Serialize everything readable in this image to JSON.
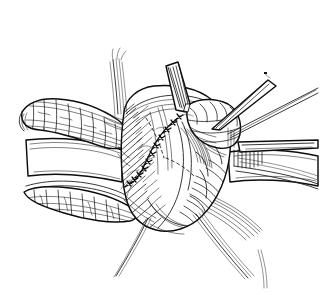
{
  "figure": {
    "kind": "line-art-illustration",
    "medium": "pen-and-ink cross-hatched drawing",
    "title": "",
    "caption": "",
    "background_color": "#ffffff",
    "ink_color": "#111111",
    "has_text": false,
    "has_color": false,
    "width": 320,
    "height": 295
  },
  "anatomy": {
    "central_mass": {
      "name": "central-organ-mass",
      "label": "",
      "description": "large rounded organ body occupying center of field, shaded with dense parallel hatching on its left flank and lower right contour",
      "bbox": [
        118,
        86,
        232,
        232
      ]
    },
    "upper_left_tube": {
      "name": "upper-left-tubular-structure",
      "label": "",
      "description": "tubular segmented structure entering from upper left, banded with transverse ring lines",
      "bbox": [
        18,
        96,
        128,
        148
      ]
    },
    "lower_left_tube": {
      "name": "lower-left-tubular-structure",
      "label": "",
      "description": "second flattened tubular structure at lower left with cobbled mucosal texture",
      "bbox": [
        20,
        176,
        136,
        224
      ]
    },
    "upper_right_tissue": {
      "name": "upper-right-tissue-flap",
      "label": "",
      "description": "scalloped lobulated tissue flap at upper right retracted by instrument",
      "bbox": [
        186,
        98,
        240,
        148
      ]
    },
    "field_base": {
      "name": "operative-field-base",
      "label": "",
      "description": "broad pale wound bed sheets framing the field on left and right"
    }
  },
  "sutures": {
    "anastomosis_line": {
      "name": "anastomotic-suture-line",
      "label": "",
      "description": "interrupted suture line with knots descending from upper center of the mass then curving left",
      "knot_count": 11
    },
    "threads": [
      {
        "name": "suture-thread-top-left-bundle",
        "label": "",
        "description": "bundle of fine thread strands rising to upper left"
      },
      {
        "name": "suture-thread-bottom-left",
        "label": "",
        "description": "long curved thread tail sweeping down-left out of frame"
      },
      {
        "name": "suture-thread-bottom-right",
        "label": "",
        "description": "long curved thread tail sweeping down-right out of frame"
      },
      {
        "name": "suture-thread-right",
        "label": "",
        "description": "thread tail passing to the right edge"
      }
    ]
  },
  "instruments": [
    {
      "name": "retractor-blade-upper-right",
      "label": "",
      "description": "tapered instrument blade angled down-left from upper right corner, with second shaft beneath",
      "tip": [
        213,
        128
      ]
    },
    {
      "name": "retractor-blade-top-center",
      "label": "",
      "description": "broad flat blade descending from top center into the field",
      "tip": [
        186,
        110
      ]
    },
    {
      "name": "retractor-blade-right",
      "label": "",
      "description": "horizontal retractor blade holding the right wound edge open",
      "tip": [
        238,
        158
      ]
    }
  ],
  "shading": {
    "technique": "cross-hatching and parallel line hatching",
    "stroke_color": "#111111",
    "density_note": "heaviest along left flank of the central mass and beneath the right retractor"
  }
}
